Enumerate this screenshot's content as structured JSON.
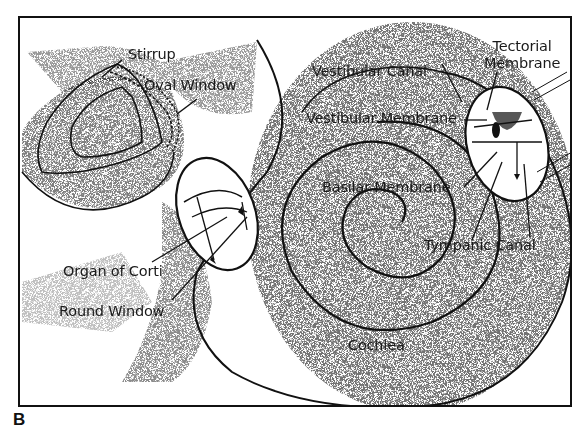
{
  "figure": {
    "letter": "B",
    "colors": {
      "ink": "#111111",
      "background": "#ffffff",
      "stipple": "#333333"
    }
  },
  "labels": {
    "stirrup": "Stirrup",
    "oval_window": "Oval Window",
    "vestibular_canal": "Vestibular Canal",
    "tectorial_membrane_line1": "Tectorial",
    "tectorial_membrane_line2": "Membrane",
    "vestibular_membrane": "Vestibular Membrane",
    "basilar_membrane": "Basilar Membrane",
    "tympanic_canal": "Tympanic Canal",
    "organ_of_corti": "Organ of Corti",
    "round_window": "Round Window",
    "cochlea": "Cochlea"
  }
}
